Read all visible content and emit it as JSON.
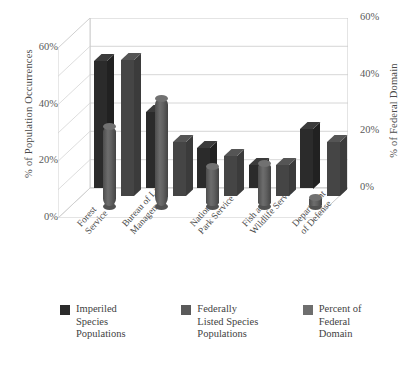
{
  "chart_data": {
    "type": "bar",
    "title": "",
    "subtitle": "",
    "xlabel": "",
    "ylabel": "% of Population Occurrences",
    "y2label": "% of Federal Domain",
    "ylim": [
      0,
      60
    ],
    "y2lim": [
      0,
      60
    ],
    "yticks": [
      "0%",
      "20%",
      "40%",
      "60%"
    ],
    "y2ticks": [
      "0%",
      "20%",
      "40%",
      "60%"
    ],
    "grid": true,
    "legend_position": "bottom",
    "three_d": true,
    "categories": [
      "Forest\nService",
      "Bureau of Land\nManagement",
      "National\nPark Service",
      "Fish and\nWildlife Service",
      "Department\nof Defense"
    ],
    "category_lines": [
      [
        "Forest",
        "Service"
      ],
      [
        "Bureau of Land",
        "Management"
      ],
      [
        "National",
        "Park Service"
      ],
      [
        "Fish and",
        "Wildlife Service"
      ],
      [
        "Department",
        "of Defense"
      ]
    ],
    "series": [
      {
        "name": "Imperiled Species Populations",
        "axis": "left",
        "shape": "prism",
        "color": "#2b2b2b",
        "values": [
          45,
          27,
          14,
          8,
          21
        ]
      },
      {
        "name": "Federally Listed Species Populations",
        "axis": "left",
        "shape": "cylinder",
        "color": "#5f5f5f",
        "values": [
          28,
          38,
          14,
          15,
          3
        ]
      },
      {
        "name": "Percent of Federal Domain",
        "axis": "right",
        "shape": "prism",
        "color": "#454545",
        "values": [
          48,
          19,
          14,
          11,
          19
        ]
      }
    ]
  },
  "axes": {
    "left": {
      "title": "% of Population Occurrences",
      "ticks": [
        "60%",
        "40%",
        "20%",
        "0%"
      ]
    },
    "right": {
      "title": "% of Federal Domain",
      "ticks": [
        "60%",
        "40%",
        "20%",
        "0%"
      ]
    }
  },
  "legend": {
    "items": [
      {
        "label": "Imperiled Species Populations",
        "color": "#2b2b2b"
      },
      {
        "label": "Federally Listed Species Populations",
        "color": "#5a5a5a"
      },
      {
        "label": "Percent of Federal Domain",
        "color": "#6e6e6e"
      }
    ]
  }
}
